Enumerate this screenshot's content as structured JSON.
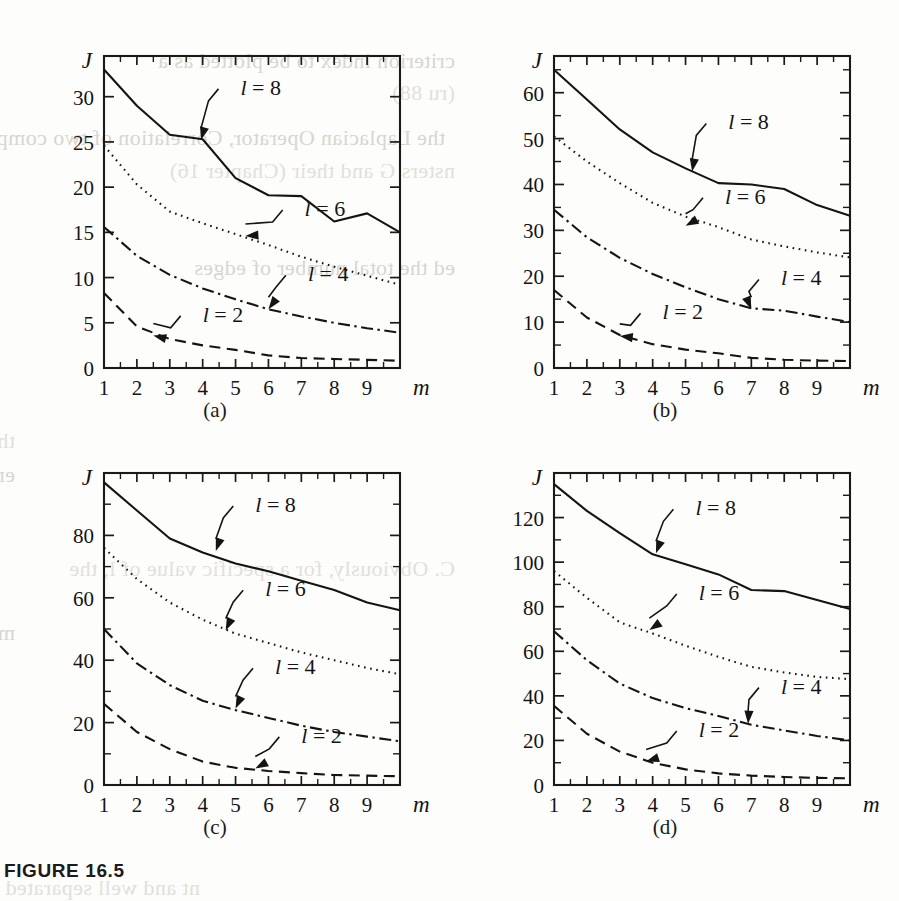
{
  "caption": "FIGURE 16.5",
  "axis": {
    "y_name": "J",
    "x_name": "m"
  },
  "panel_labels": [
    "(a)",
    "(b)",
    "(c)",
    "(d)"
  ],
  "series_labels": [
    "l = 8",
    "l = 6",
    "l = 4",
    "l = 2"
  ],
  "colors": {
    "ink": "#141414",
    "page": "#fdfdfb",
    "bleed": "#d8d6cf"
  },
  "bleed_text": [
    "criterion index to be plotted as a",
    "(ru 88)",
    "the Laplacian Operator, Correlation of two complex functions",
    "nsters G and their (Chapter 16)",
    "ed the total number of edges",
    "ther is the diameter of a cluster C is the distance of its two most distant",
    "ements. Hence, it can be viewed as a measure of dissimilarity of the points in the",
    "C. Obviously, for a specific value of l, the",
    "ma hen a property of a partition F, the number of clusters m, and the",
    "nt and well separated clusters"
  ],
  "chart_data": [
    {
      "type": "line",
      "panel": "(a)",
      "title": "",
      "xlabel": "m",
      "ylabel": "J",
      "xlim": [
        1,
        10
      ],
      "ylim": [
        0,
        34.5
      ],
      "xticks": [
        1,
        2,
        3,
        4,
        5,
        6,
        7,
        8,
        9
      ],
      "xticklabels": [
        "1",
        "2",
        "3",
        "4",
        "5",
        "6",
        "7",
        "8",
        "9"
      ],
      "yticks": [
        0,
        5,
        10,
        15,
        20,
        25,
        30
      ],
      "yticklabels": [
        "0",
        "5",
        "10",
        "15",
        "20",
        "25",
        "30"
      ],
      "yminor": [],
      "grid": false,
      "legend_position": "inline-annotations",
      "series": [
        {
          "name": "l = 8",
          "style": "solid",
          "x": [
            1,
            2,
            3,
            4,
            5,
            6,
            7,
            8,
            9,
            10
          ],
          "values": [
            33.0,
            29.0,
            25.8,
            25.3,
            21.0,
            19.1,
            19.0,
            16.2,
            17.1,
            15.0
          ],
          "label_xy": [
            5.15,
            30.2
          ],
          "arrow_to": [
            3.95,
            25.2
          ]
        },
        {
          "name": "l = 6",
          "style": "dotted",
          "x": [
            1,
            2,
            3,
            4,
            5,
            6,
            7,
            8,
            9,
            10
          ],
          "values": [
            24.6,
            20.3,
            17.3,
            16.0,
            14.8,
            13.6,
            12.3,
            11.2,
            10.2,
            9.2
          ],
          "label_xy": [
            7.1,
            16.8
          ],
          "arrow_to": [
            5.3,
            14.6
          ]
        },
        {
          "name": "l = 4",
          "style": "dashdot",
          "x": [
            1,
            2,
            3,
            4,
            5,
            6,
            7,
            8,
            9,
            10
          ],
          "values": [
            15.6,
            12.4,
            10.3,
            8.8,
            7.6,
            6.5,
            5.7,
            5.0,
            4.4,
            3.9
          ],
          "label_xy": [
            7.2,
            9.6
          ],
          "arrow_to": [
            6.0,
            6.5
          ]
        },
        {
          "name": "l = 2",
          "style": "dashed",
          "x": [
            1,
            2,
            3,
            4,
            5,
            6,
            7,
            8,
            9,
            10
          ],
          "values": [
            8.3,
            4.6,
            3.2,
            2.5,
            2.0,
            1.4,
            1.1,
            1.0,
            0.9,
            0.8
          ],
          "label_xy": [
            4.0,
            5.1
          ],
          "arrow_to": [
            2.5,
            3.6
          ]
        }
      ]
    },
    {
      "type": "line",
      "panel": "(b)",
      "title": "",
      "xlabel": "m",
      "ylabel": "J",
      "xlim": [
        1,
        10
      ],
      "ylim": [
        0,
        68
      ],
      "xticks": [
        1,
        2,
        3,
        4,
        5,
        6,
        7,
        8,
        9
      ],
      "xticklabels": [
        "1",
        "2",
        "3",
        "4",
        "5",
        "6",
        "7",
        "8",
        "9"
      ],
      "yticks": [
        0,
        10,
        20,
        30,
        40,
        50,
        60
      ],
      "yticklabels": [
        "0",
        "10",
        "20",
        "30",
        "40",
        "50",
        "60"
      ],
      "yminor": [
        5,
        15,
        25,
        35,
        45,
        55,
        65
      ],
      "grid": false,
      "legend_position": "inline-annotations",
      "series": [
        {
          "name": "l = 8",
          "style": "solid",
          "x": [
            1,
            2,
            3,
            4,
            5,
            6,
            7,
            8,
            9,
            10
          ],
          "values": [
            65.0,
            58.5,
            52.0,
            47.0,
            43.5,
            40.3,
            40.0,
            39.0,
            35.5,
            33.2
          ],
          "label_xy": [
            6.3,
            52.0
          ],
          "arrow_to": [
            5.2,
            42.8
          ]
        },
        {
          "name": "l = 6",
          "style": "dotted",
          "x": [
            1,
            2,
            3,
            4,
            5,
            6,
            7,
            8,
            9,
            10
          ],
          "values": [
            50.5,
            45.0,
            40.3,
            36.0,
            33.0,
            30.7,
            28.0,
            26.5,
            25.2,
            24.1
          ],
          "label_xy": [
            6.2,
            35.8
          ],
          "arrow_to": [
            5.0,
            31.0
          ]
        },
        {
          "name": "l = 4",
          "style": "dashdot",
          "x": [
            1,
            2,
            3,
            4,
            5,
            6,
            7,
            8,
            9,
            10
          ],
          "values": [
            34.5,
            28.5,
            24.0,
            20.5,
            17.6,
            15.0,
            13.0,
            12.5,
            11.2,
            10.0
          ],
          "label_xy": [
            7.9,
            18.0
          ],
          "arrow_to": [
            7.0,
            12.8
          ]
        },
        {
          "name": "l = 2",
          "style": "dashed",
          "x": [
            1,
            2,
            3,
            4,
            5,
            6,
            7,
            8,
            9,
            10
          ],
          "values": [
            17.0,
            11.0,
            7.2,
            5.2,
            4.0,
            3.2,
            2.2,
            1.8,
            1.6,
            1.5
          ],
          "label_xy": [
            4.3,
            10.6
          ],
          "arrow_to": [
            3.0,
            7.0
          ]
        }
      ]
    },
    {
      "type": "line",
      "panel": "(c)",
      "title": "",
      "xlabel": "m",
      "ylabel": "J",
      "xlim": [
        1,
        10
      ],
      "ylim": [
        0,
        100
      ],
      "xticks": [
        1,
        2,
        3,
        4,
        5,
        6,
        7,
        8,
        9
      ],
      "xticklabels": [
        "1",
        "2",
        "3",
        "4",
        "5",
        "6",
        "7",
        "8",
        "9"
      ],
      "yticks": [
        0,
        20,
        40,
        60,
        80
      ],
      "yticklabels": [
        "0",
        "20",
        "40",
        "60",
        "80"
      ],
      "yminor": [
        10,
        30,
        50,
        70,
        90
      ],
      "grid": false,
      "legend_position": "inline-annotations",
      "series": [
        {
          "name": "l = 8",
          "style": "solid",
          "x": [
            1,
            2,
            3,
            4,
            5,
            6,
            7,
            8,
            9,
            10
          ],
          "values": [
            97.0,
            88.0,
            79.0,
            74.5,
            71.0,
            68.5,
            65.5,
            62.5,
            58.5,
            56.0
          ],
          "label_xy": [
            5.6,
            87.5
          ],
          "arrow_to": [
            4.4,
            75.0
          ]
        },
        {
          "name": "l = 6",
          "style": "dotted",
          "x": [
            1,
            2,
            3,
            4,
            5,
            6,
            7,
            8,
            9,
            10
          ],
          "values": [
            76.0,
            66.0,
            58.5,
            53.0,
            48.5,
            45.5,
            42.5,
            40.0,
            37.5,
            35.5
          ],
          "label_xy": [
            5.9,
            60.5
          ],
          "arrow_to": [
            4.7,
            49.5
          ]
        },
        {
          "name": "l = 4",
          "style": "dashdot",
          "x": [
            1,
            2,
            3,
            4,
            5,
            6,
            7,
            8,
            9,
            10
          ],
          "values": [
            50.0,
            39.0,
            32.0,
            27.0,
            24.0,
            21.5,
            19.0,
            17.0,
            15.5,
            14.0
          ],
          "label_xy": [
            6.2,
            35.5
          ],
          "arrow_to": [
            5.0,
            24.5
          ]
        },
        {
          "name": "l = 2",
          "style": "dashed",
          "x": [
            1,
            2,
            3,
            4,
            5,
            6,
            7,
            8,
            9,
            10
          ],
          "values": [
            26.0,
            17.0,
            11.5,
            7.5,
            5.5,
            4.5,
            3.8,
            3.2,
            3.0,
            2.8
          ],
          "label_xy": [
            7.0,
            13.5
          ],
          "arrow_to": [
            5.6,
            5.3
          ]
        }
      ]
    },
    {
      "type": "line",
      "panel": "(d)",
      "title": "",
      "xlabel": "m",
      "ylabel": "J",
      "xlim": [
        1,
        10
      ],
      "ylim": [
        0,
        140
      ],
      "xticks": [
        1,
        2,
        3,
        4,
        5,
        6,
        7,
        8,
        9
      ],
      "xticklabels": [
        "1",
        "2",
        "3",
        "4",
        "5",
        "6",
        "7",
        "8",
        "9"
      ],
      "yticks": [
        0,
        20,
        40,
        60,
        80,
        100,
        120
      ],
      "yticklabels": [
        "0",
        "20",
        "40",
        "60",
        "80",
        "100",
        "120"
      ],
      "yminor": [
        10,
        30,
        50,
        70,
        90,
        110,
        130
      ],
      "grid": false,
      "legend_position": "inline-annotations",
      "series": [
        {
          "name": "l = 8",
          "style": "solid",
          "x": [
            1,
            2,
            3,
            4,
            5,
            6,
            7,
            8,
            9,
            10
          ],
          "values": [
            135.0,
            123.0,
            113.0,
            103.5,
            99.0,
            94.5,
            87.5,
            87.0,
            83.0,
            79.0
          ],
          "label_xy": [
            5.3,
            121.0
          ],
          "arrow_to": [
            4.1,
            104.0
          ]
        },
        {
          "name": "l = 6",
          "style": "dotted",
          "x": [
            1,
            2,
            3,
            4,
            5,
            6,
            7,
            8,
            9,
            10
          ],
          "values": [
            96.0,
            84.0,
            73.0,
            68.0,
            62.5,
            57.5,
            53.0,
            50.5,
            48.5,
            47.5
          ],
          "label_xy": [
            5.4,
            83.0
          ],
          "arrow_to": [
            3.9,
            69.5
          ]
        },
        {
          "name": "l = 4",
          "style": "dashdot",
          "x": [
            1,
            2,
            3,
            4,
            5,
            6,
            7,
            8,
            9,
            10
          ],
          "values": [
            69.0,
            56.0,
            45.5,
            39.0,
            34.5,
            31.0,
            27.0,
            24.5,
            22.0,
            20.0
          ],
          "label_xy": [
            7.9,
            41.0
          ],
          "arrow_to": [
            6.9,
            27.5
          ]
        },
        {
          "name": "l = 2",
          "style": "dashed",
          "x": [
            1,
            2,
            3,
            4,
            5,
            6,
            7,
            8,
            9,
            10
          ],
          "values": [
            35.5,
            23.0,
            15.0,
            10.0,
            7.0,
            5.2,
            4.2,
            3.6,
            3.2,
            3.0
          ],
          "label_xy": [
            5.4,
            21.5
          ],
          "arrow_to": [
            3.8,
            10.5
          ]
        }
      ]
    }
  ]
}
